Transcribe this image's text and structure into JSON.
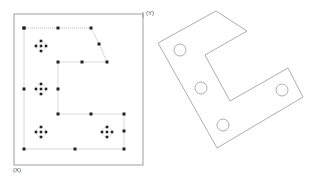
{
  "left_diagram": {
    "frame": {
      "x": 14,
      "y": 14,
      "w": 129,
      "h": 151
    },
    "axis_labels": {
      "y": "(Y)",
      "x": "(X)"
    },
    "path_points": [
      [
        24,
        28
      ],
      [
        58,
        28
      ],
      [
        91,
        28
      ],
      [
        99,
        44
      ],
      [
        107,
        62
      ],
      [
        82,
        62
      ],
      [
        58,
        62
      ],
      [
        58,
        89
      ],
      [
        58,
        114
      ],
      [
        91,
        114
      ],
      [
        124,
        114
      ],
      [
        124,
        131
      ],
      [
        124,
        149
      ],
      [
        75,
        149
      ],
      [
        24,
        149
      ],
      [
        24,
        89
      ],
      [
        24,
        28
      ]
    ],
    "hole_clusters": [
      [
        41,
        46
      ],
      [
        41,
        89
      ],
      [
        41,
        132
      ],
      [
        107,
        132
      ]
    ]
  },
  "right_diagram": {
    "outline": [
      [
        158,
        43
      ],
      [
        216,
        11
      ],
      [
        247,
        31
      ],
      [
        205,
        55
      ],
      [
        230,
        101
      ],
      [
        288,
        68
      ],
      [
        303,
        97
      ],
      [
        217,
        148
      ]
    ],
    "holes": [
      [
        180,
        50
      ],
      [
        201,
        88
      ],
      [
        223,
        125
      ],
      [
        282,
        90
      ]
    ],
    "hole_radius": 6
  },
  "colors": {
    "line": "#999999",
    "point": "#222222",
    "frame": "#888888"
  }
}
